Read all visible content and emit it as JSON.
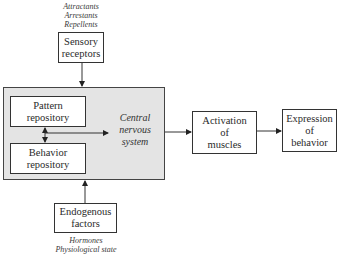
{
  "diagram": {
    "inputs_top": {
      "stimuli": [
        "Attractants",
        "Arrestants",
        "Repellents"
      ],
      "box": [
        "Sensory",
        "receptors"
      ]
    },
    "central": {
      "label": [
        "Central",
        "nervous",
        "system"
      ],
      "pattern_repository": [
        "Pattern",
        "repository"
      ],
      "behavior_repository": [
        "Behavior",
        "repository"
      ]
    },
    "inputs_bottom": {
      "box": [
        "Endogenous",
        "factors"
      ],
      "notes": [
        "Hormones",
        "Physiological state"
      ]
    },
    "outputs": {
      "activation": [
        "Activation",
        "of",
        "muscles"
      ],
      "expression": [
        "Expression",
        "of",
        "behavior"
      ]
    },
    "colors": {
      "central_fill": "#e4e4e4",
      "stroke": "#333333"
    }
  }
}
